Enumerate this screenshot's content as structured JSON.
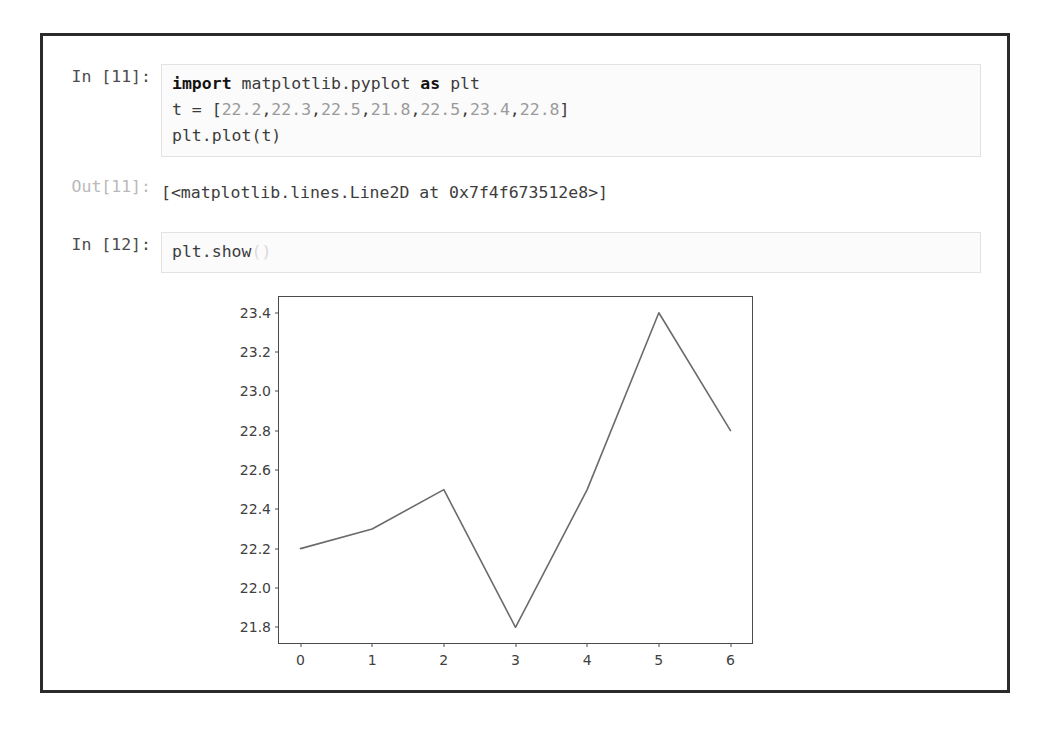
{
  "notebook": {
    "cells": [
      {
        "type": "code",
        "prompt": "In [11]:",
        "lines": [
          [
            {
              "t": "import",
              "c": "kw"
            },
            {
              "t": " matplotlib.pyplot ",
              "c": "name"
            },
            {
              "t": "as",
              "c": "kw"
            },
            {
              "t": " plt",
              "c": "name"
            }
          ],
          [
            {
              "t": "t = [",
              "c": "punct"
            },
            {
              "t": "22.2",
              "c": "num"
            },
            {
              "t": ",",
              "c": "punct"
            },
            {
              "t": "22.3",
              "c": "num"
            },
            {
              "t": ",",
              "c": "punct"
            },
            {
              "t": "22.5",
              "c": "num"
            },
            {
              "t": ",",
              "c": "punct"
            },
            {
              "t": "21.8",
              "c": "num"
            },
            {
              "t": ",",
              "c": "punct"
            },
            {
              "t": "22.5",
              "c": "num"
            },
            {
              "t": ",",
              "c": "punct"
            },
            {
              "t": "23.4",
              "c": "num"
            },
            {
              "t": ",",
              "c": "punct"
            },
            {
              "t": "22.8",
              "c": "num"
            },
            {
              "t": "]",
              "c": "punct"
            }
          ],
          [
            {
              "t": "plt.plot(t)",
              "c": "name"
            }
          ]
        ]
      },
      {
        "type": "output",
        "prompt": "Out[11]:",
        "text": "[<matplotlib.lines.Line2D at 0x7f4f673512e8>]"
      },
      {
        "type": "code",
        "prompt": "In [12]:",
        "lines": [
          [
            {
              "t": "plt.show",
              "c": "name"
            },
            {
              "t": "()",
              "c": "faded"
            }
          ]
        ]
      }
    ]
  },
  "chart_data": {
    "type": "line",
    "title": "",
    "xlabel": "",
    "ylabel": "",
    "x": [
      0,
      1,
      2,
      3,
      4,
      5,
      6
    ],
    "values": [
      22.2,
      22.3,
      22.5,
      21.8,
      22.5,
      23.4,
      22.8
    ],
    "series": [
      {
        "name": "t",
        "values": [
          22.2,
          22.3,
          22.5,
          21.8,
          22.5,
          23.4,
          22.8
        ],
        "color": "#6b6b6b"
      }
    ],
    "xlim": [
      -0.3,
      6.3
    ],
    "ylim": [
      21.72,
      23.48
    ],
    "xticks": [
      0,
      1,
      2,
      3,
      4,
      5,
      6
    ],
    "xtick_labels": [
      "0",
      "1",
      "2",
      "3",
      "4",
      "5",
      "6"
    ],
    "yticks": [
      21.8,
      22.0,
      22.2,
      22.4,
      22.6,
      22.8,
      23.0,
      23.2,
      23.4
    ],
    "ytick_labels": [
      "21.8",
      "22.0",
      "22.2",
      "22.4",
      "22.6",
      "22.8",
      "23.0",
      "23.2",
      "23.4"
    ],
    "grid": false,
    "legend": "none",
    "line_color": "#6b6b6b",
    "frame_color": "#4a4a4a"
  }
}
